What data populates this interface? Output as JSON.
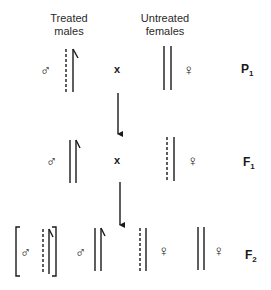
{
  "headers": {
    "treated_males": [
      "Treated",
      "males"
    ],
    "untreated_females": [
      "Untreated",
      "females"
    ]
  },
  "symbols": {
    "male": "♂",
    "female": "♀",
    "cross": "x"
  },
  "generations": {
    "p1": {
      "letter": "P",
      "sub": "1"
    },
    "f1": {
      "letter": "F",
      "sub": "1"
    },
    "f2": {
      "letter": "F",
      "sub": "2"
    }
  },
  "colors": {
    "ink": "#1a1a1a",
    "background": "#ffffff"
  }
}
